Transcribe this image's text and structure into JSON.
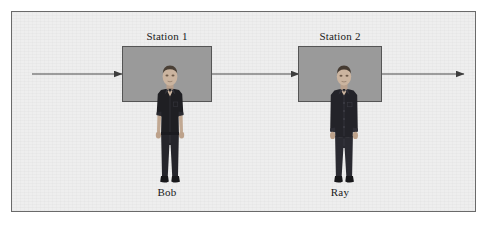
{
  "diagram": {
    "type": "process-flow",
    "background_color": "#eeeeee",
    "border_color": "#6a6a6a",
    "box_fill_color": "#9a9a9a",
    "box_border_color": "#555555",
    "line_color": "#4a4a4a",
    "stations": [
      {
        "id": "station-1",
        "label": "Station 1",
        "worker_name": "Bob",
        "box": {
          "x": 110,
          "y": 34,
          "width": 90,
          "height": 56
        }
      },
      {
        "id": "station-2",
        "label": "Station 2",
        "worker_name": "Ray",
        "box": {
          "x": 286,
          "y": 34,
          "width": 84,
          "height": 56
        }
      }
    ],
    "arrows": [
      {
        "id": "arrow-inflow",
        "from_x": 20,
        "to_x": 110,
        "y": 62,
        "direction": "right"
      },
      {
        "id": "arrow-between-stations",
        "from_x": 200,
        "to_x": 286,
        "y": 62,
        "direction": "right"
      },
      {
        "id": "arrow-outflow",
        "from_x": 370,
        "to_x": 452,
        "y": 62,
        "direction": "right"
      }
    ]
  }
}
